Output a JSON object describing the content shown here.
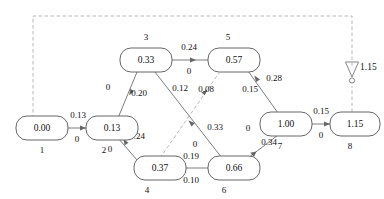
{
  "diagram": {
    "colors": {
      "node_stroke": "#555555",
      "edge_solid": "#666666",
      "edge_dashed": "#aaaaaa",
      "text": "#111111",
      "background": "#ffffff"
    },
    "nodes": [
      {
        "id": "1",
        "value": "0.00",
        "x": 42,
        "y": 128
      },
      {
        "id": "2",
        "value": "0.13",
        "x": 110,
        "y": 128
      },
      {
        "id": "3",
        "value": "0.33",
        "x": 146,
        "y": 60
      },
      {
        "id": "4",
        "value": "0.37",
        "x": 146,
        "y": 168
      },
      {
        "id": "5",
        "value": "0.57",
        "x": 232,
        "y": 60
      },
      {
        "id": "6",
        "value": "0.66",
        "x": 232,
        "y": 168
      },
      {
        "id": "7",
        "value": "1.00",
        "x": 288,
        "y": 124
      },
      {
        "id": "8",
        "value": "1.15",
        "x": 352,
        "y": 124
      }
    ],
    "edges": [
      {
        "from": "1",
        "to": "2",
        "upper": "0.13",
        "lower": "0",
        "style": "solid",
        "arrow": "to"
      },
      {
        "from": "2",
        "to": "3",
        "upper": "0",
        "lower": "0.20",
        "style": "solid",
        "arrow": "to"
      },
      {
        "from": "2",
        "to": "4",
        "upper": "0",
        "lower": "0.24",
        "style": "solid",
        "arrow": "to"
      },
      {
        "from": "3",
        "to": "5",
        "upper": "0.24",
        "lower": "0",
        "style": "solid",
        "arrow": "to"
      },
      {
        "from": "3",
        "to": "6",
        "upper": "0.33",
        "lower": "0",
        "style": "solid",
        "arrow": "to"
      },
      {
        "from": "4",
        "to": "5",
        "upper": "0.08",
        "lower": "0.12",
        "style": "dashed",
        "arrow": "to"
      },
      {
        "from": "6",
        "to": "4",
        "upper": "0.19",
        "lower": "0.10",
        "style": "solid",
        "arrow": "to"
      },
      {
        "from": "5",
        "to": "7",
        "upper": "0.28",
        "lower": "0.15",
        "style": "solid",
        "arrow": "to"
      },
      {
        "from": "6",
        "to": "7",
        "upper": "0.34",
        "lower": "0",
        "style": "solid",
        "arrow": "to"
      },
      {
        "from": "7",
        "to": "8",
        "upper": "0.15",
        "lower": "0",
        "style": "solid",
        "arrow": "to"
      }
    ],
    "feedback": {
      "style": "dashed",
      "label": "1.15",
      "marker": "triangle-down-with-circle",
      "from": "8",
      "to": "1"
    },
    "edge_labels": {
      "e12_upper": "0.13",
      "e12_lower": "0",
      "e23_upper": "0",
      "e23_lower": "0.20",
      "e24_upper": "0",
      "e24_lower": "0.24",
      "e35_upper": "0.24",
      "e35_lower": "0",
      "e36_upper": "0.33",
      "e36_lower": "0",
      "e45_upper": "0.08",
      "e45_lower": "0.12",
      "e64_upper": "0.19",
      "e64_lower": "0.10",
      "e57_upper": "0.28",
      "e57_lower": "0.15",
      "e67_upper": "0.34",
      "e67_lower": "0",
      "e78_upper": "0.15",
      "e78_lower": "0",
      "feedback_value": "1.15"
    },
    "node_values": {
      "n1": "0.00",
      "n2": "0.13",
      "n3": "0.33",
      "n4": "0.37",
      "n5": "0.57",
      "n6": "0.66",
      "n7": "1.00",
      "n8": "1.15"
    },
    "node_ids": {
      "n1": "1",
      "n2": "2",
      "n3": "3",
      "n4": "4",
      "n5": "5",
      "n6": "6",
      "n7": "7",
      "n8": "8"
    }
  }
}
